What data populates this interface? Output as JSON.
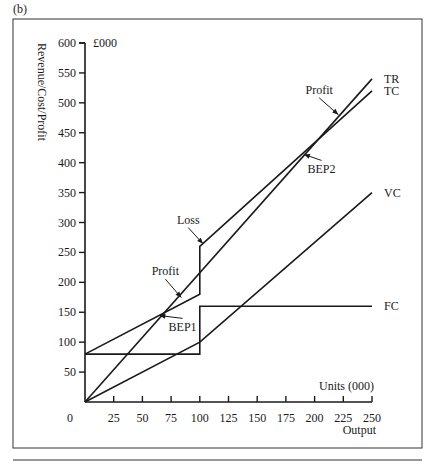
{
  "panel_label": "(b)",
  "chart_data": {
    "type": "line",
    "title": "",
    "xlabel": "Output",
    "xunit_label": "Units (000)",
    "ylabel": "Revenue/Cost/Profit",
    "yunit_label": "£000",
    "xlim": [
      0,
      250
    ],
    "ylim": [
      0,
      600
    ],
    "grid": false,
    "legend": "inline labels at line ends",
    "x_ticks": [
      0,
      25,
      50,
      75,
      100,
      125,
      150,
      175,
      200,
      225,
      250
    ],
    "y_ticks": [
      50,
      100,
      150,
      200,
      250,
      300,
      350,
      400,
      450,
      500,
      550,
      600
    ],
    "series": [
      {
        "name": "TR",
        "points": [
          [
            0,
            0
          ],
          [
            250,
            540
          ]
        ]
      },
      {
        "name": "TC",
        "points": [
          [
            0,
            80
          ],
          [
            100,
            180
          ],
          [
            100,
            260
          ],
          [
            250,
            520
          ]
        ]
      },
      {
        "name": "VC",
        "points": [
          [
            0,
            0
          ],
          [
            100,
            100
          ],
          [
            250,
            350
          ]
        ]
      },
      {
        "name": "FC",
        "points": [
          [
            0,
            80
          ],
          [
            100,
            80
          ],
          [
            100,
            160
          ],
          [
            250,
            160
          ]
        ]
      }
    ],
    "annotations": [
      {
        "text": "BEP1",
        "x": 63,
        "y": 145,
        "label_x": 85,
        "label_y": 118
      },
      {
        "text": "BEP2",
        "x": 189,
        "y": 415,
        "label_x": 206,
        "label_y": 382
      },
      {
        "text": "Profit",
        "x": 85,
        "y": 172,
        "label_x": 70,
        "label_y": 212,
        "note": "region between TC and TR before step"
      },
      {
        "text": "Loss",
        "x": 104,
        "y": 262,
        "label_x": 90,
        "label_y": 298
      },
      {
        "text": "Profit",
        "x": 222,
        "y": 478,
        "label_x": 204,
        "label_y": 515
      }
    ],
    "zero_label": "0"
  }
}
